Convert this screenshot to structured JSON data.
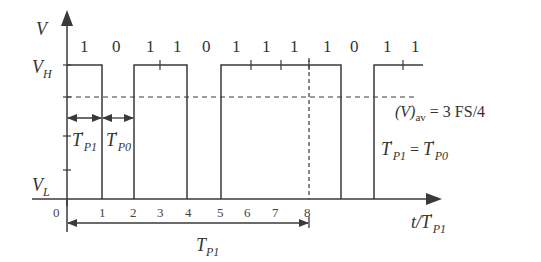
{
  "diagram": {
    "y_axis": {
      "label": "V",
      "levels": {
        "high": "V",
        "high_sub": "H",
        "low": "V",
        "low_sub": "L"
      }
    },
    "x_axis": {
      "label_main": "t/T",
      "label_prime": "′",
      "label_sub": "P1",
      "ticks": [
        "0",
        "1",
        "2",
        "3",
        "4",
        "5",
        "6",
        "7",
        "8"
      ]
    },
    "bits": [
      "1",
      "0",
      "1",
      "1",
      "0",
      "1",
      "1",
      "1",
      "1",
      "0",
      "1",
      "1"
    ],
    "annotations": {
      "tp1_prime": {
        "main": "T",
        "prime": "′",
        "sub": "P1"
      },
      "tp0_prime": {
        "main": "T",
        "prime": "′",
        "sub": "P0"
      },
      "tp1_period": {
        "main": "T",
        "sub": "P1"
      },
      "average": {
        "prefix": "(V)",
        "sub": "av",
        "rest": " = 3 FS/4"
      },
      "equality": {
        "lhs_main": "T",
        "lhs_prime": "′",
        "lhs_sub": "P1",
        "op": " = ",
        "rhs_main": "T",
        "rhs_prime": "′",
        "rhs_sub": "P0"
      }
    },
    "colors": {
      "line": "#3a3a3a",
      "text": "#333333",
      "background": "#ffffff"
    }
  }
}
